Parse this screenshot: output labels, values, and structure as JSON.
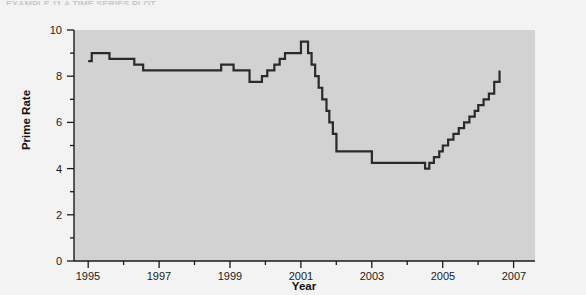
{
  "page": {
    "background_color": "#f3f3f3",
    "cropped_caption": "EXAMPLE 11    A TIME SERIES PLOT"
  },
  "chart_data": {
    "type": "line",
    "subtype": "step",
    "title": "",
    "xlabel": "Year",
    "ylabel": "Prime Rate",
    "xlim": [
      1994.6,
      2007.6
    ],
    "ylim": [
      0,
      10
    ],
    "grid": false,
    "legend": "none",
    "panel_color": "#d2d2d2",
    "line_color": "#2a2a2a",
    "line_width": 2.2,
    "xticks": [
      1995,
      1997,
      1999,
      2001,
      2003,
      2005,
      2007
    ],
    "xtick_labels": [
      "1995",
      "1997",
      "1999",
      "2001",
      "2003",
      "2005",
      "2007"
    ],
    "xminorticks": [
      1996,
      1998,
      2000,
      2002,
      2004,
      2006
    ],
    "yticks": [
      0,
      2,
      4,
      6,
      8,
      10
    ],
    "ytick_labels": [
      "0",
      "2",
      "4",
      "6",
      "8",
      "10"
    ],
    "yminorticks": [
      1,
      3,
      5,
      7,
      9
    ],
    "x": [
      1995.0,
      1995.1,
      1995.45,
      1995.6,
      1996.1,
      1996.3,
      1996.55,
      1997.0,
      1998.0,
      1998.75,
      1998.9,
      1999.1,
      1999.45,
      1999.55,
      1999.75,
      1999.9,
      2000.05,
      2000.25,
      2000.4,
      2000.55,
      2001.0,
      2001.05,
      2001.2,
      2001.3,
      2001.4,
      2001.5,
      2001.6,
      2001.72,
      2001.8,
      2001.9,
      2002.0,
      2002.85,
      2003.0,
      2003.55,
      2004.5,
      2004.62,
      2004.75,
      2004.9,
      2005.0,
      2005.15,
      2005.3,
      2005.45,
      2005.6,
      2005.75,
      2005.9,
      2006.0,
      2006.15,
      2006.3,
      2006.45,
      2006.6
    ],
    "values": [
      8.65,
      9.0,
      9.0,
      8.75,
      8.75,
      8.5,
      8.25,
      8.25,
      8.25,
      8.5,
      8.5,
      8.25,
      8.25,
      7.75,
      7.75,
      8.0,
      8.25,
      8.5,
      8.75,
      9.0,
      9.5,
      9.5,
      9.0,
      8.5,
      8.0,
      7.5,
      7.0,
      6.5,
      6.0,
      5.5,
      4.75,
      4.75,
      4.25,
      4.25,
      4.0,
      4.25,
      4.5,
      4.75,
      5.0,
      5.25,
      5.5,
      5.75,
      6.0,
      6.25,
      6.5,
      6.75,
      7.0,
      7.25,
      7.75,
      8.25
    ],
    "series_name": "Prime Rate",
    "notes": {
      "start_value": 8.65,
      "peak_value": 9.5,
      "peak_year": 2001,
      "trough_value": 4.0,
      "trough_year": 2004,
      "end_value": 8.25,
      "end_year": 2006.6
    }
  }
}
